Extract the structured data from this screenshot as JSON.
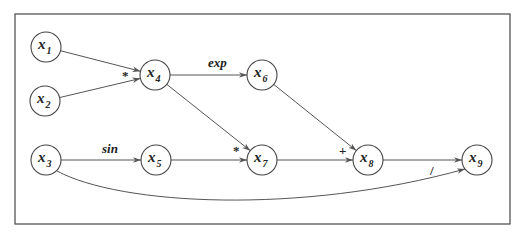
{
  "diagram": {
    "frame": {
      "x": 15,
      "y": 14,
      "width": 495,
      "height": 210
    },
    "nodes": [
      {
        "id": "x1",
        "var": "x",
        "sub": "1",
        "cx": 46,
        "cy": 47
      },
      {
        "id": "x2",
        "var": "x",
        "sub": "2",
        "cx": 45,
        "cy": 101
      },
      {
        "id": "x3",
        "var": "x",
        "sub": "3",
        "cx": 46,
        "cy": 160
      },
      {
        "id": "x4",
        "var": "x",
        "sub": "4",
        "cx": 155,
        "cy": 75
      },
      {
        "id": "x5",
        "var": "x",
        "sub": "5",
        "cx": 156,
        "cy": 160
      },
      {
        "id": "x6",
        "var": "x",
        "sub": "6",
        "cx": 262,
        "cy": 75
      },
      {
        "id": "x7",
        "var": "x",
        "sub": "7",
        "cx": 262,
        "cy": 160
      },
      {
        "id": "x8",
        "var": "x",
        "sub": "8",
        "cx": 368,
        "cy": 160
      },
      {
        "id": "x9",
        "var": "x",
        "sub": "9",
        "cx": 477,
        "cy": 160
      }
    ],
    "node_radius": 15,
    "edges": [
      {
        "from": "x1",
        "to": "x4"
      },
      {
        "from": "x2",
        "to": "x4"
      },
      {
        "from": "x4",
        "to": "x6"
      },
      {
        "from": "x4",
        "to": "x7"
      },
      {
        "from": "x3",
        "to": "x5"
      },
      {
        "from": "x5",
        "to": "x7"
      },
      {
        "from": "x6",
        "to": "x8"
      },
      {
        "from": "x7",
        "to": "x8"
      },
      {
        "from": "x8",
        "to": "x9"
      },
      {
        "from": "x3",
        "to": "x9",
        "curved": true
      }
    ],
    "operations": [
      {
        "label": "*",
        "x": 122,
        "y": 80,
        "kind": "sym"
      },
      {
        "label": "exp",
        "x": 208,
        "y": 67,
        "kind": "op"
      },
      {
        "label": "sin",
        "x": 102,
        "y": 153,
        "kind": "op"
      },
      {
        "label": "*",
        "x": 233,
        "y": 155,
        "kind": "sym"
      },
      {
        "label": "+",
        "x": 339,
        "y": 155,
        "kind": "sym"
      },
      {
        "label": "/",
        "x": 430,
        "y": 175,
        "kind": "sym"
      }
    ]
  }
}
